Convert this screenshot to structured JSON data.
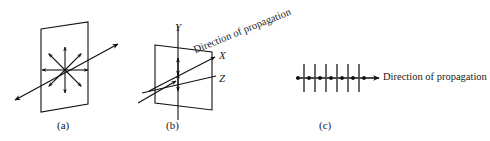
{
  "figure": {
    "background_color": "#ffffff",
    "stroke_color": "#111111",
    "width": 490,
    "height": 141,
    "panels": [
      {
        "id": "a",
        "caption": "(a)",
        "description": "unpolarized-wave",
        "plane": {
          "points": "41,29 88,22 88,104 41,112",
          "corners": [
            [
              41,
              29
            ],
            [
              88,
              22
            ],
            [
              88,
              104
            ],
            [
              41,
              112
            ]
          ]
        },
        "propagation_ray": {
          "from": [
            15,
            100
          ],
          "to": [
            118,
            44
          ],
          "arrowheads": [
            "start",
            "end"
          ]
        },
        "center": [
          65,
          70
        ],
        "vector_count": 8,
        "vector_length": 23,
        "vector_angles_deg": [
          0,
          45,
          90,
          135,
          180,
          225,
          270,
          315
        ]
      },
      {
        "id": "b",
        "caption": "(b)",
        "description": "plane-polarized-wave",
        "plane": {
          "points": "155,45 212,52 212,110 155,103",
          "corners": [
            [
              155,
              45
            ],
            [
              212,
              52
            ],
            [
              212,
              110
            ],
            [
              155,
              103
            ]
          ]
        },
        "y_axis": {
          "label": "Y",
          "from": [
            178,
            26
          ],
          "to": [
            178,
            118
          ]
        },
        "z_axis": {
          "label": "Z",
          "from": [
            142,
            92
          ],
          "to": [
            217,
            76
          ]
        },
        "x_axis": {
          "label": "X",
          "from": [
            150,
            90
          ],
          "to": [
            216,
            57
          ],
          "arrowhead": "end"
        },
        "incoming_ray": {
          "from": [
            140,
            102
          ],
          "to": [
            174,
            80
          ],
          "arrowhead": "end"
        },
        "propagation_label": "Direction of propagation",
        "propagation_label_rotation_deg": -22,
        "oscillation_arrows": [
          {
            "from": [
              178,
              58
            ],
            "to": [
              178,
              74
            ],
            "arrowheads": "double"
          },
          {
            "from": [
              178,
              74
            ],
            "to": [
              178,
              90
            ],
            "arrowheads": "double"
          }
        ]
      },
      {
        "id": "c",
        "caption": "(c)",
        "description": "longitudinal-wave-propagation",
        "axis": {
          "from": [
            296,
            78
          ],
          "to": [
            378,
            78
          ],
          "arrowhead": "end"
        },
        "propagation_label": "Direction of propagation",
        "dots": {
          "count": 7,
          "radius": 1.8,
          "x_positions": [
            298,
            309,
            320,
            331,
            342,
            353,
            364
          ],
          "y": 78
        },
        "ticks": {
          "count": 6,
          "x_positions": [
            304,
            315,
            326,
            337,
            348,
            359
          ],
          "y_top": 64,
          "y_bottom": 92
        }
      }
    ]
  }
}
